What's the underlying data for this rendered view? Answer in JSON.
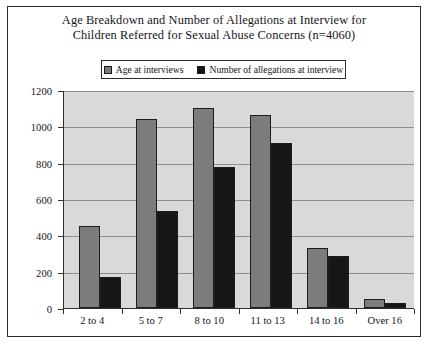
{
  "title": {
    "line1": "Age Breakdown and Number of Allegations at Interview for",
    "line2": "Children Referred for Sexual Abuse Concerns (n=4060)"
  },
  "legend": {
    "entries": [
      {
        "label": "Age at interviews",
        "color": "#7c7c7c"
      },
      {
        "label": "Number of allegations at interview",
        "color": "#161616"
      }
    ]
  },
  "colors": {
    "series_a": "#7c7c7c",
    "series_b": "#161616",
    "plot_background": "#d9d9d9",
    "gridline": "#8d8d8d",
    "frame": "#2b2b2b"
  },
  "chart_data": {
    "type": "bar",
    "title": "Age Breakdown and Number of Allegations at Interview for Children Referred for Sexual Abuse Concerns (n=4060)",
    "xlabel": "",
    "ylabel": "",
    "ylim": [
      0,
      1200
    ],
    "yticks": [
      0,
      200,
      400,
      600,
      800,
      1000,
      1200
    ],
    "grid": true,
    "legend_position": "top",
    "categories": [
      "2 to 4",
      "5 to 7",
      "8 to 10",
      "11 to 13",
      "14 to 16",
      "Over 16"
    ],
    "series": [
      {
        "name": "Age at interviews",
        "color": "#7c7c7c",
        "values": [
          450,
          1040,
          1100,
          1065,
          330,
          50
        ]
      },
      {
        "name": "Number of allegations at interview",
        "color": "#161616",
        "values": [
          170,
          535,
          775,
          910,
          285,
          25
        ]
      }
    ]
  }
}
